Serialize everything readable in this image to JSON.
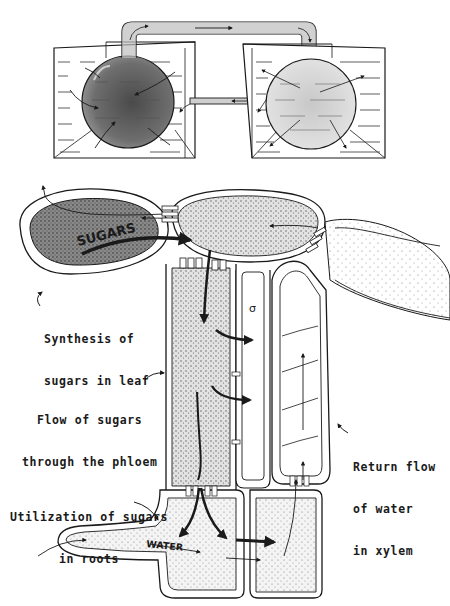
{
  "figure": {
    "top_panel": {
      "description": "Two-bulb osmometer model: left bulb with concentrated solute connected by tube to right bulb with dilute solute, both immersed in water tanks, connected below by a narrow tube"
    },
    "bottom_panel": {
      "inline_labels": {
        "sugars": "SUGARS",
        "water": "WATER",
        "nucleus_symbol": "σ"
      },
      "callouts": [
        {
          "id": "leaf",
          "line1": "Synthesis of",
          "line2": "sugars in leaf"
        },
        {
          "id": "phloem",
          "line1": "Flow of sugars",
          "line2": "through the phloem"
        },
        {
          "id": "xylem",
          "line1": "Return flow",
          "line2": "of water",
          "line3": "in xylem"
        },
        {
          "id": "roots",
          "line1": "Utilization of sugars",
          "line2": "in roots"
        }
      ]
    },
    "colors": {
      "ink": "#1a1a1a",
      "dark_fill": "#6a6a6a",
      "medium_fill": "#a8a8a8",
      "light_fill": "#d4d4d4",
      "background": "#ffffff"
    }
  }
}
